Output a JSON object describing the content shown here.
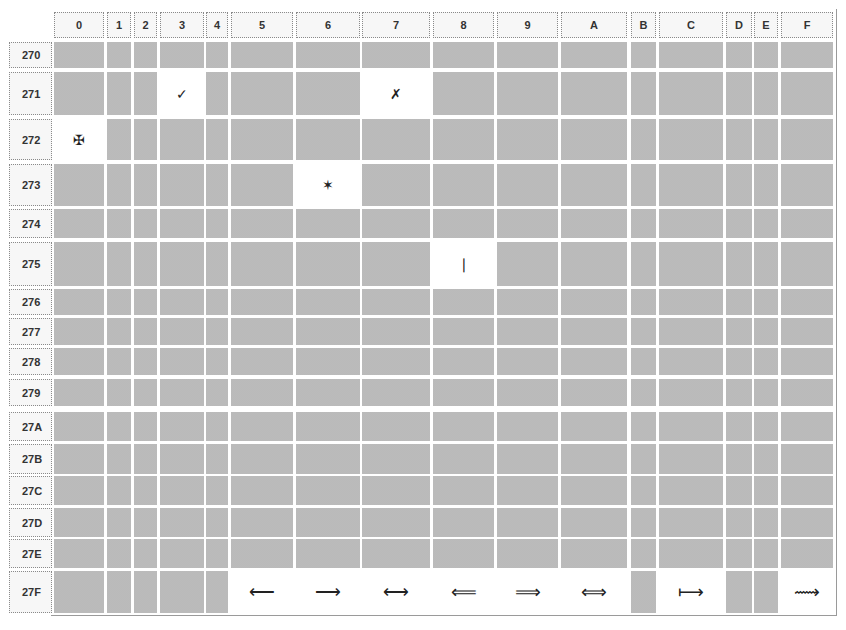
{
  "table": {
    "columns": [
      "0",
      "1",
      "2",
      "3",
      "4",
      "5",
      "6",
      "7",
      "8",
      "9",
      "A",
      "B",
      "C",
      "D",
      "E",
      "F"
    ],
    "rows": [
      "270",
      "271",
      "272",
      "273",
      "274",
      "275",
      "276",
      "277",
      "278",
      "279",
      "27A",
      "27B",
      "27C",
      "27D",
      "27E",
      "27F"
    ],
    "glyphs": [
      {
        "row": "271",
        "col": "3",
        "char": "✓",
        "name": "check-mark-icon"
      },
      {
        "row": "271",
        "col": "7",
        "char": "✗",
        "name": "ballot-x-icon"
      },
      {
        "row": "272",
        "col": "0",
        "char": "✠",
        "name": "maltese-cross-icon"
      },
      {
        "row": "273",
        "col": "6",
        "char": "✶",
        "name": "six-pointed-star-icon"
      },
      {
        "row": "275",
        "col": "8",
        "char": "❘",
        "name": "vertical-bar-icon"
      },
      {
        "row": "27F",
        "col": "5",
        "char": "⟵",
        "name": "long-left-arrow-icon"
      },
      {
        "row": "27F",
        "col": "6",
        "char": "⟶",
        "name": "long-right-arrow-icon"
      },
      {
        "row": "27F",
        "col": "7",
        "char": "⟷",
        "name": "long-left-right-arrow-icon"
      },
      {
        "row": "27F",
        "col": "8",
        "char": "⟸",
        "name": "long-left-double-arrow-icon"
      },
      {
        "row": "27F",
        "col": "9",
        "char": "⟹",
        "name": "long-right-double-arrow-icon"
      },
      {
        "row": "27F",
        "col": "A",
        "char": "⟺",
        "name": "long-left-right-double-arrow-icon"
      },
      {
        "row": "27F",
        "col": "C",
        "char": "⟼",
        "name": "long-maps-to-arrow-icon"
      },
      {
        "row": "27F",
        "col": "F",
        "char": "⟿",
        "name": "long-squiggle-arrow-icon"
      }
    ]
  },
  "colors": {
    "empty_cell": "#c2c2c2",
    "header_bg": "#f7f7f7",
    "glyph_bg": "#ffffff"
  }
}
